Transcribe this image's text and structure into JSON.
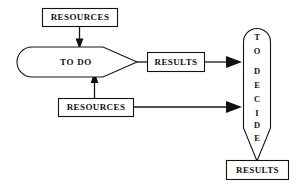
{
  "diagram": {
    "background_color": "#ffffff",
    "line_color": "#16120f",
    "text_color": "#15120f",
    "nodes": {
      "resources_top": {
        "label": "RESOURCES",
        "shape": "rectangle"
      },
      "resources_bottom": {
        "label": "RESOURCES",
        "shape": "rectangle"
      },
      "to_do": {
        "label": "TO DO",
        "shape": "horizontal-arrow-rounded-left"
      },
      "results_middle": {
        "label": "RESULTS",
        "shape": "rectangle"
      },
      "to_decide": {
        "label": "TO DECIDE",
        "shape": "vertical-arrow-rounded-top",
        "letters": [
          "T",
          "O",
          "",
          "D",
          "E",
          "C",
          "I",
          "D",
          "E"
        ]
      },
      "results_bottom": {
        "label": "RESULTS",
        "shape": "rectangle"
      }
    },
    "edges": [
      {
        "from": "resources_top",
        "to": "to_do",
        "direction": "down"
      },
      {
        "from": "resources_bottom",
        "to": "to_do",
        "direction": "up"
      },
      {
        "from": "to_do",
        "to": "results_middle",
        "direction": "right"
      },
      {
        "from": "results_middle",
        "to": "to_decide",
        "direction": "right"
      },
      {
        "from": "resources_bottom",
        "to": "to_decide",
        "direction": "right"
      },
      {
        "from": "to_decide",
        "to": "results_bottom",
        "direction": "down"
      }
    ]
  }
}
